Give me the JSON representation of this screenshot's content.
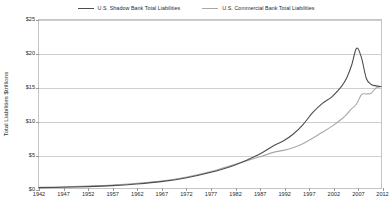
{
  "chart_data": {
    "type": "line",
    "title": "",
    "xlabel": "",
    "ylabel": "Total Liabilities $trillions",
    "xlim": [
      1942,
      2012
    ],
    "ylim": [
      0,
      25
    ],
    "grid": true,
    "legend_position": "top-center",
    "xticks": [
      1942,
      1947,
      1952,
      1957,
      1962,
      1967,
      1972,
      1977,
      1982,
      1987,
      1992,
      1997,
      2002,
      2007,
      2012
    ],
    "yticks": [
      0,
      5,
      10,
      15,
      20,
      25
    ],
    "ytick_labels": [
      "$0",
      "$5",
      "$10",
      "$15",
      "$20",
      "$25"
    ],
    "x": [
      1942,
      1947,
      1952,
      1957,
      1962,
      1967,
      1972,
      1977,
      1982,
      1987,
      1990,
      1992,
      1994,
      1996,
      1998,
      2000,
      2002,
      2004,
      2005,
      2006,
      2007,
      2008,
      2009,
      2010,
      2011,
      2012
    ],
    "series": [
      {
        "name": "U.S. Shadow Bank Total Liabilities",
        "color": "#4d4d4d",
        "values": [
          0.05,
          0.1,
          0.2,
          0.35,
          0.6,
          0.95,
          1.5,
          2.3,
          3.4,
          5.0,
          6.3,
          7.0,
          8.0,
          9.4,
          11.2,
          12.6,
          13.6,
          15.2,
          16.4,
          18.3,
          20.8,
          19.4,
          16.3,
          15.4,
          15.2,
          15.1
        ]
      },
      {
        "name": "U.S. Commercial Bank Total Liabilities",
        "color": "#a8a8a8",
        "values": [
          0.1,
          0.18,
          0.3,
          0.45,
          0.7,
          1.05,
          1.6,
          2.4,
          3.5,
          4.6,
          5.3,
          5.6,
          6.0,
          6.6,
          7.4,
          8.3,
          9.2,
          10.3,
          11.0,
          11.8,
          12.5,
          13.9,
          14.0,
          14.1,
          14.9,
          15.1
        ]
      }
    ]
  },
  "legend": {
    "items": [
      {
        "label": "U.S. Shadow Bank Total Liabilities",
        "color": "#4d4d4d"
      },
      {
        "label": "U.S. Commercial Bank Total Liabilities",
        "color": "#a8a8a8"
      }
    ]
  }
}
